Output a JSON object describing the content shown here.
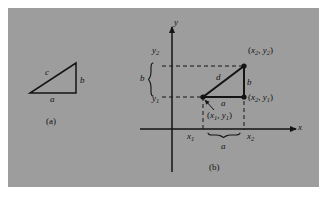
{
  "figure": {
    "background_color": "#9d9d9d",
    "page_color": "#ffffff",
    "ink_color": "#141414",
    "panel_a_caption": "(a)",
    "panel_b_caption": "(b)"
  },
  "panel_a": {
    "name": "right-triangle-abc",
    "side_hypotenuse_label": "c",
    "side_vertical_label": "b",
    "side_horizontal_label": "a",
    "vertices": {
      "bottom_left": [
        30,
        93
      ],
      "bottom_right": [
        76,
        93
      ],
      "top_right": [
        76,
        63
      ]
    }
  },
  "panel_b": {
    "name": "distance-formula-on-axes",
    "axis_x_label": "x",
    "axis_y_label": "y",
    "point_1_label_open": "(",
    "point_1_label": "x",
    "point_1_sub": "1",
    "point_1_label2": "y",
    "point_1_sub2": "1",
    "point_1_full": "(x1, y1)",
    "point_2_full": "(x2, y2)",
    "point_3_full": "(x2, y1)",
    "tick_y2": "y",
    "tick_y2_sub": "2",
    "tick_y1": "y",
    "tick_y1_sub": "1",
    "tick_x1": "x",
    "tick_x1_sub": "1",
    "tick_x2": "x",
    "tick_x2_sub": "2",
    "brace_vertical_label": "b",
    "brace_horizontal_label": "a",
    "leg_vertical_label": "b",
    "leg_horizontal_label": "a",
    "hypotenuse_label": "d",
    "origin": [
      172,
      129
    ],
    "vertices": {
      "p1": [
        203,
        97
      ],
      "p2": [
        244,
        66
      ],
      "p3": [
        244,
        97
      ]
    }
  }
}
